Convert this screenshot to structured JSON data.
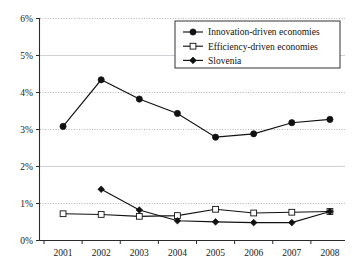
{
  "chart_data": {
    "type": "line",
    "title": "",
    "xlabel": "",
    "ylabel": "",
    "categories": [
      "2001",
      "2002",
      "2003",
      "2004",
      "2005",
      "2006",
      "2007",
      "2008"
    ],
    "x_tick_labels": [
      "2001",
      "2002",
      "2003",
      "2004",
      "2005",
      "2006",
      "2007",
      "2008"
    ],
    "y_tick_labels": [
      "0%",
      "1%",
      "2%",
      "3%",
      "4%",
      "5%",
      "6%"
    ],
    "y_tick_values": [
      0,
      1,
      2,
      3,
      4,
      5,
      6
    ],
    "ylim": [
      0,
      6
    ],
    "y_unit": "%",
    "grid": true,
    "grid_axis": "y",
    "legend_position": "top-right",
    "series": [
      {
        "name": "Innovation-driven economies",
        "marker": "filled-circle",
        "color": "#111111",
        "x": [
          "2001",
          "2002",
          "2003",
          "2004",
          "2005",
          "2006",
          "2007",
          "2008"
        ],
        "values": [
          3.07,
          4.33,
          3.81,
          3.42,
          2.78,
          2.87,
          3.17,
          3.26
        ]
      },
      {
        "name": "Efficiency-driven economies",
        "marker": "open-square",
        "color": "#111111",
        "x": [
          "2001",
          "2002",
          "2003",
          "2004",
          "2005",
          "2006",
          "2007",
          "2008"
        ],
        "values": [
          0.71,
          0.69,
          0.64,
          0.66,
          0.83,
          0.73,
          0.75,
          0.77
        ]
      },
      {
        "name": "Slovenia",
        "marker": "filled-diamond",
        "color": "#111111",
        "x": [
          "2002",
          "2003",
          "2004",
          "2005",
          "2006",
          "2007",
          "2008"
        ],
        "values": [
          1.37,
          0.81,
          0.52,
          0.49,
          0.47,
          0.47,
          0.77
        ]
      }
    ]
  },
  "legend": {
    "entries": [
      {
        "label": "Innovation-driven economies",
        "marker": "filled-circle"
      },
      {
        "label": "Efficiency-driven economies",
        "marker": "open-square"
      },
      {
        "label": "Slovenia",
        "marker": "filled-diamond"
      }
    ]
  },
  "axis": {
    "y_labels": [
      "6%",
      "5%",
      "4%",
      "3%",
      "2%",
      "1%",
      "0%"
    ],
    "x_labels": [
      "2001",
      "2002",
      "2003",
      "2004",
      "2005",
      "2006",
      "2007",
      "2008"
    ]
  }
}
